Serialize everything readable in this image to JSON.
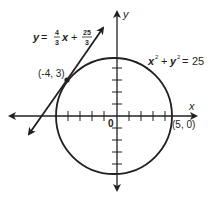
{
  "figure": {
    "type": "coordinate-plane-diagram",
    "axes": {
      "x_label": "x",
      "y_label": "y",
      "origin_label": "0",
      "tick_count_each_side": 4
    },
    "circle": {
      "equation": {
        "lhs_x": "x",
        "lhs_y": "y",
        "exp": "2",
        "plus": "+",
        "equals": "=",
        "rhs": "25"
      },
      "center": [
        0,
        0
      ],
      "radius": 5
    },
    "tangent_line": {
      "equation": {
        "y": "y",
        "equals": "=",
        "slope_num": "4",
        "slope_den": "3",
        "x": "x",
        "plus": "+",
        "int_num": "25",
        "int_den": "3"
      },
      "slope": 1.3333,
      "y_intercept": 8.3333
    },
    "points": [
      {
        "label": "(-4, 3)",
        "x": -4,
        "y": 3,
        "marked": true
      },
      {
        "label": "(5, 0)",
        "x": 5,
        "y": 0,
        "marked": false
      }
    ],
    "colors": {
      "ink": "#231f20",
      "background": "#ffffff"
    }
  }
}
